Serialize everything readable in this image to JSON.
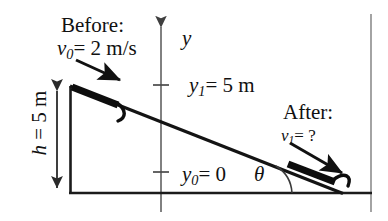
{
  "figure": {
    "background_color": "#ffffff",
    "ink_color": "#111111",
    "axis_color": "#6b6b6b",
    "width": 388,
    "height": 221
  },
  "labels": {
    "before_heading": "Before:",
    "initial_speed_symbol": "v",
    "initial_speed_subscript": "0",
    "initial_speed_value": "= 2 m/s",
    "after_heading": "After:",
    "final_speed_symbol": "v",
    "final_speed_subscript": "1",
    "final_speed_value": "= ?",
    "y_axis": "y",
    "y1_symbol": "y",
    "y1_subscript": "1",
    "y1_value": "= 5 m",
    "y0_symbol": "y",
    "y0_subscript": "0",
    "y0_value": "= 0",
    "angle_symbol": "θ",
    "height_symbol": "h",
    "height_value": "= 5 m"
  },
  "geometry": {
    "incline_top": [
      70,
      86
    ],
    "incline_bottom": [
      341,
      193
    ],
    "baseline_left": [
      70,
      193
    ],
    "baseline_right": [
      372,
      193
    ],
    "y_axis_x": 161,
    "y_axis_top": [
      161,
      21
    ],
    "y_axis_bottom": [
      161,
      212
    ],
    "tick_y1": [
      161,
      85
    ],
    "tick_y0": [
      161,
      172
    ],
    "height_arrow_x": 57,
    "height_arrow_top": 86,
    "height_arrow_bottom": 193,
    "before_arrow_start": [
      77,
      61
    ],
    "before_arrow_end": [
      124,
      83
    ],
    "after_arrow_start": [
      291,
      144
    ],
    "after_arrow_end": [
      346,
      176
    ],
    "right_rule_x": 371
  },
  "physics_data": {
    "type": "free-body-incline",
    "initial_speed_m_s": 2,
    "final_speed_m_s": null,
    "height_m": 5,
    "y1_m": 5,
    "y0_m": 0,
    "angle_label": "theta",
    "description": "A block slides down an incline of height 5 m starting with speed 2 m/s; final speed is unknown."
  }
}
